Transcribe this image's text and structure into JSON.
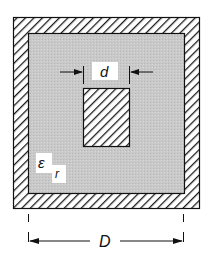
{
  "diagram": {
    "labels": {
      "inner_width": "d",
      "outer_width": "D",
      "permittivity_symbol": "ε",
      "permittivity_subscript": "r"
    },
    "colors": {
      "dielectric": "#c8c8c8",
      "conductor_hatch": "#1a1a1a",
      "background": "#ffffff"
    }
  }
}
